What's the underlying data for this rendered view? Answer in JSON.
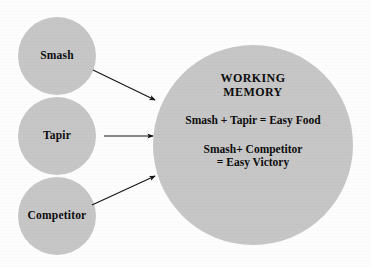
{
  "figure": {
    "background_color": "#fdfdfd",
    "node_fill_color": "#c6c6c6",
    "text_color": "#0d0d0d",
    "arrow_color": "#141414"
  },
  "sources": [
    {
      "id": "smash",
      "label": "Smash"
    },
    {
      "id": "tapir",
      "label": "Tapir"
    },
    {
      "id": "competitor",
      "label": "Competitor"
    }
  ],
  "working_memory": {
    "heading_line_1": "WORKING",
    "heading_line_2": "MEMORY",
    "equation_one": "Smash + Tapir = Easy Food",
    "equation_two_line_1": "Smash+ Competitor",
    "equation_two_line_2": "= Easy Victory"
  },
  "arrows": [
    {
      "id": "smash-to-working-memory",
      "direction": "down-right"
    },
    {
      "id": "tapir-to-working-memory",
      "direction": "right"
    },
    {
      "id": "competitor-to-working-memory",
      "direction": "up-right"
    }
  ]
}
